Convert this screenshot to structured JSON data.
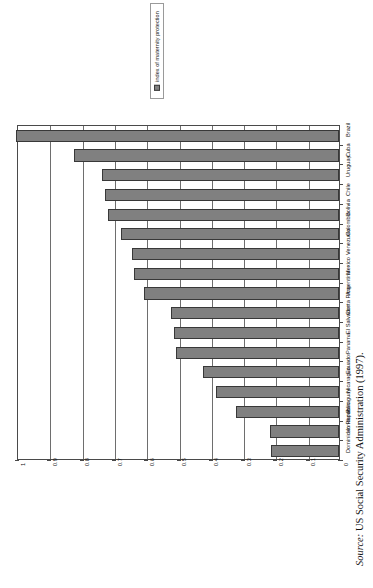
{
  "legend": {
    "label": "index of maternity protection",
    "swatch_color": "#808080",
    "marker_name": "legend-swatch"
  },
  "source": {
    "prefix": "Source:",
    "text": " US Social Security Administration (1997)."
  },
  "chart_data": {
    "type": "bar",
    "orientation": "horizontal-rotated",
    "title": "",
    "subtitle": "",
    "xlabel": "",
    "ylabel": "",
    "legend_position": "top",
    "grid": true,
    "value_axis": {
      "min": 0,
      "max": 1,
      "step": 0.1,
      "ticks": [
        "0",
        "0.1",
        "0.2",
        "0.3",
        "0.4",
        "0.5",
        "0.6",
        "0.7",
        "0.8",
        "0.9",
        "1"
      ],
      "direction": "right-to-left"
    },
    "series_name": "index of maternity protection",
    "bar_color": "#808080",
    "bar_border_color": "#383838",
    "categories": [
      "Brazil",
      "Cuba",
      "Uruguay",
      "Chile",
      "Bolivia",
      "Colombia",
      "Venezuela",
      "Mexico",
      "Argentina",
      "Costa Rica",
      "El Salvador",
      "Panama",
      "Ecuador",
      "Nicaragua",
      "Paraguay",
      "Honduras",
      "Dominican Republic"
    ],
    "values": [
      1.0,
      0.82,
      0.735,
      0.725,
      0.715,
      0.675,
      0.64,
      0.635,
      0.605,
      0.52,
      0.51,
      0.505,
      0.42,
      0.38,
      0.32,
      0.215,
      0.21
    ]
  }
}
